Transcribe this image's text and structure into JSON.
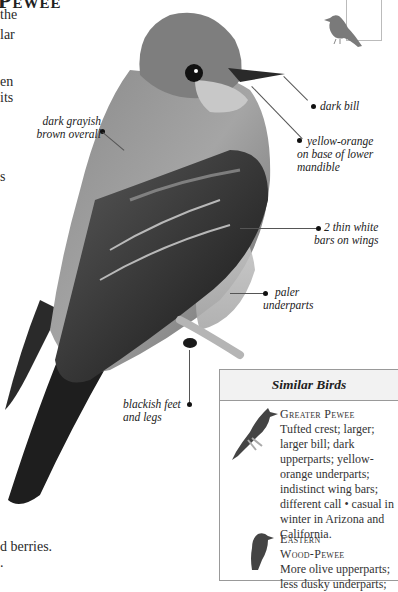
{
  "page": {
    "title_fragment": "Pewee",
    "body_fragments": [
      "the",
      "lar",
      "en",
      "its",
      "s"
    ],
    "bottom_fragments": [
      "d berries.",
      "."
    ]
  },
  "labels": {
    "dark_gray_brown": [
      "dark grayish",
      "brown overall"
    ],
    "dark_bill": "dark bill",
    "yellow_orange": [
      "yellow-orange",
      "on base of lower",
      "mandible"
    ],
    "wing_bars": [
      "2 thin white",
      "bars on wings"
    ],
    "underparts": [
      "paler",
      "underparts"
    ],
    "feet": [
      "blackish feet",
      "and legs"
    ]
  },
  "similar_birds": {
    "heading": "Similar Birds",
    "entries": [
      {
        "name": "Greater Pewee",
        "lines": [
          "Tufted crest; larger;",
          "larger bill; dark",
          "upperparts; yellow-",
          "orange underparts;",
          "indistinct wing bars;",
          "different call • casual in",
          "winter in Arizona and",
          "California."
        ]
      },
      {
        "name_lines": [
          "Eastern",
          "Wood-Pewee"
        ],
        "lines": [
          "More olive upperparts;",
          "less dusky underparts;"
        ]
      }
    ]
  },
  "colors": {
    "text": "#222222",
    "box_border": "#999999",
    "box_header_bg": "#f2f2f2",
    "leader_line": "#555555"
  }
}
